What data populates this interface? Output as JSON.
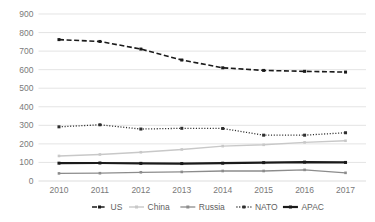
{
  "chart_data": {
    "type": "line",
    "title": "",
    "xlabel": "",
    "ylabel": "",
    "categories": [
      "2010",
      "2011",
      "2012",
      "2013",
      "2014",
      "2015",
      "2016",
      "2017"
    ],
    "x": [
      2010,
      2011,
      2012,
      2013,
      2014,
      2015,
      2016,
      2017
    ],
    "ylim": [
      0,
      900
    ],
    "yticks": [
      0,
      100,
      200,
      300,
      400,
      500,
      600,
      700,
      800,
      900
    ],
    "ytick_labels": [
      "0",
      "100",
      "200",
      "300",
      "400",
      "500",
      "600",
      "700",
      "800",
      "900"
    ],
    "grid": true,
    "legend_position": "bottom",
    "series": [
      {
        "name": "US",
        "values": [
          762,
          752,
          711,
          652,
          610,
          596,
          591,
          587
        ],
        "color": "#1a1a1a",
        "style": "dashed",
        "width": 1.6,
        "marker": "square"
      },
      {
        "name": "China",
        "values": [
          135,
          143,
          155,
          170,
          188,
          195,
          208,
          217
        ],
        "color": "#c8c8c8",
        "style": "solid",
        "width": 1.4,
        "marker": "square"
      },
      {
        "name": "Russia",
        "values": [
          41,
          42,
          47,
          49,
          54,
          54,
          60,
          44
        ],
        "color": "#8c8c8c",
        "style": "solid",
        "width": 1.3,
        "marker": "square"
      },
      {
        "name": "NATO",
        "values": [
          292,
          303,
          280,
          284,
          283,
          247,
          247,
          260
        ],
        "color": "#2e2e2e",
        "style": "dotted",
        "width": 1.3,
        "marker": "square"
      },
      {
        "name": "APAC",
        "values": [
          96,
          97,
          95,
          94,
          96,
          99,
          102,
          100
        ],
        "color": "#1a1a1a",
        "style": "solid",
        "width": 2.2,
        "marker": "square"
      }
    ]
  },
  "legend": {
    "items": [
      {
        "label": "US"
      },
      {
        "label": "China"
      },
      {
        "label": "Russia"
      },
      {
        "label": "NATO"
      },
      {
        "label": "APAC"
      }
    ]
  }
}
